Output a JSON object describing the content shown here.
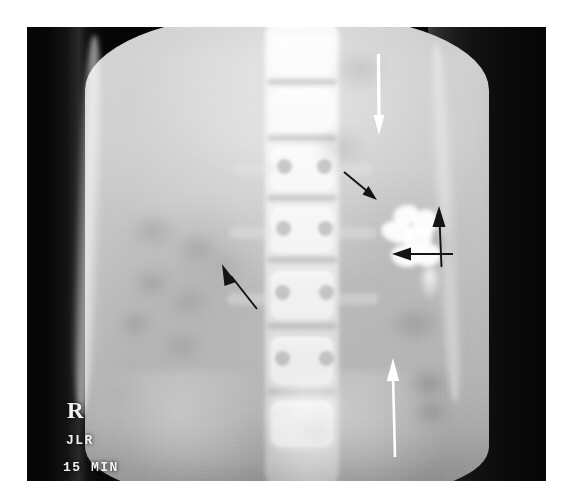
{
  "figure": {
    "modality": "radiograph",
    "view": "anteroposterior-abdomen",
    "study": "intravenous-urogram",
    "canvas": {
      "width": 579,
      "height": 499
    },
    "film": {
      "left": 27,
      "top": 27,
      "width": 519,
      "height": 454
    },
    "background_color": "#ffffff",
    "film_base_color": "#060606",
    "soft_tissue_color": "#c2c2c2",
    "contrast_color": "#ffffff"
  },
  "markers": {
    "side_label": "R",
    "technologist_initials": "JLR",
    "delay_label": "15 MIN",
    "orientation_label": "N",
    "text_color": "#f2f2f2"
  },
  "annotations": {
    "arrows": [
      {
        "id": "arrow-white-top",
        "name": "white-arrow-upper-left-kidney",
        "color": "#ffffff",
        "direction": "down",
        "tail": {
          "x": 371,
          "y": 57
        },
        "tip": {
          "x": 372,
          "y": 108
        }
      },
      {
        "id": "arrow-black-1",
        "name": "black-arrow-upper-calyx",
        "color": "#111111",
        "direction": "down-right",
        "tail": {
          "x": 348,
          "y": 175
        },
        "tip": {
          "x": 371,
          "y": 194
        }
      },
      {
        "id": "arrow-black-2",
        "name": "black-arrow-lateral-calyx",
        "color": "#111111",
        "direction": "up",
        "tail": {
          "x": 416,
          "y": 240
        },
        "tip": {
          "x": 413,
          "y": 206
        }
      },
      {
        "id": "arrow-black-3",
        "name": "black-arrow-renal-pelvis",
        "color": "#111111",
        "direction": "left",
        "tail": {
          "x": 432,
          "y": 254
        },
        "tip": {
          "x": 385,
          "y": 254
        }
      },
      {
        "id": "arrow-black-4",
        "name": "black-arrow-right-kidney",
        "color": "#111111",
        "direction": "up-left",
        "tail": {
          "x": 252,
          "y": 297
        },
        "tip": {
          "x": 223,
          "y": 263
        }
      },
      {
        "id": "arrow-white-bottom",
        "name": "white-arrow-left-ureter",
        "color": "#ffffff",
        "direction": "up",
        "tail": {
          "x": 396,
          "y": 424
        },
        "tip": {
          "x": 393,
          "y": 357
        }
      }
    ]
  },
  "anatomy": {
    "spine": {
      "label": "lumbar-spine",
      "center_x": 275,
      "vertebrae": [
        {
          "y": 34,
          "height": 40,
          "width": 62
        },
        {
          "y": 88,
          "height": 42,
          "width": 63
        },
        {
          "y": 146,
          "height": 44,
          "width": 64
        },
        {
          "y": 206,
          "height": 46,
          "width": 65
        },
        {
          "y": 270,
          "height": 48,
          "width": 66
        },
        {
          "y": 336,
          "height": 48,
          "width": 66
        },
        {
          "y": 400,
          "height": 46,
          "width": 64
        }
      ],
      "disc_spaces_y": [
        78,
        134,
        194,
        256,
        322,
        388
      ]
    },
    "kidneys": [
      {
        "side": "right",
        "x": 150,
        "y": 200,
        "width": 110,
        "height": 150
      },
      {
        "side": "left",
        "x": 336,
        "y": 170,
        "width": 116,
        "height": 160
      }
    ],
    "bowel_gas_blobs": [
      {
        "x": 128,
        "y": 212,
        "w": 52,
        "h": 40,
        "shade": "rgba(128,128,128,0.34)"
      },
      {
        "x": 176,
        "y": 232,
        "w": 46,
        "h": 36,
        "shade": "rgba(120,120,120,0.30)"
      },
      {
        "x": 132,
        "y": 268,
        "w": 40,
        "h": 32,
        "shade": "rgba(118,118,118,0.32)"
      },
      {
        "x": 168,
        "y": 286,
        "w": 44,
        "h": 34,
        "shade": "rgba(126,126,126,0.26)"
      },
      {
        "x": 118,
        "y": 310,
        "w": 38,
        "h": 30,
        "shade": "rgba(116,116,116,0.30)"
      },
      {
        "x": 160,
        "y": 330,
        "w": 46,
        "h": 34,
        "shade": "rgba(124,124,124,0.26)"
      },
      {
        "x": 206,
        "y": 252,
        "w": 40,
        "h": 30,
        "shade": "rgba(128,128,128,0.22)"
      },
      {
        "x": 330,
        "y": 48,
        "w": 62,
        "h": 46,
        "shade": "rgba(140,140,140,0.26)"
      },
      {
        "x": 312,
        "y": 128,
        "w": 58,
        "h": 42,
        "shade": "rgba(134,134,134,0.24)"
      },
      {
        "x": 406,
        "y": 226,
        "w": 52,
        "h": 40,
        "shade": "rgba(126,126,126,0.26)"
      },
      {
        "x": 388,
        "y": 304,
        "w": 56,
        "h": 42,
        "shade": "rgba(112,112,112,0.32)"
      },
      {
        "x": 406,
        "y": 368,
        "w": 44,
        "h": 34,
        "shade": "rgba(96,96,96,0.38)"
      },
      {
        "x": 412,
        "y": 398,
        "w": 38,
        "h": 30,
        "shade": "rgba(92,92,92,0.36)"
      },
      {
        "x": 228,
        "y": 420,
        "w": 50,
        "h": 38,
        "shade": "rgba(150,150,150,0.22)"
      },
      {
        "x": 292,
        "y": 414,
        "w": 48,
        "h": 36,
        "shade": "rgba(146,146,146,0.22)"
      },
      {
        "x": 100,
        "y": 378,
        "w": 44,
        "h": 34,
        "shade": "rgba(150,150,150,0.20)"
      }
    ],
    "contrast_structures": {
      "label": "left-renal-collecting-system",
      "calyces": [
        {
          "x": 14,
          "y": 2,
          "w": 26,
          "h": 20,
          "rot": -18
        },
        {
          "x": 2,
          "y": 18,
          "w": 34,
          "h": 22,
          "rot": 12
        },
        {
          "x": 24,
          "y": 22,
          "w": 30,
          "h": 26,
          "rot": -30
        },
        {
          "x": 34,
          "y": 6,
          "w": 24,
          "h": 28,
          "rot": 24
        },
        {
          "x": 12,
          "y": 42,
          "w": 30,
          "h": 22,
          "rot": 8
        },
        {
          "x": 36,
          "y": 40,
          "w": 26,
          "h": 24,
          "rot": -14
        }
      ]
    }
  }
}
